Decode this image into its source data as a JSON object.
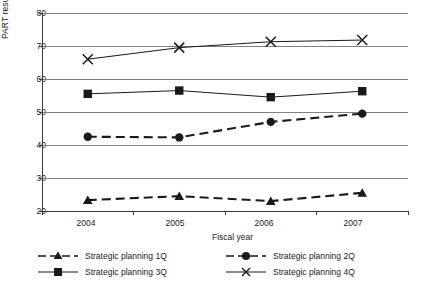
{
  "chart_data": {
    "type": "line",
    "title": "",
    "xlabel": "Fiscal year",
    "ylabel": "PART results score",
    "categories": [
      "2004",
      "2005",
      "2006",
      "2007"
    ],
    "ylim": [
      20,
      80
    ],
    "yticks": [
      "20",
      "30",
      "40",
      "50",
      "60",
      "70",
      "80"
    ],
    "grid": true,
    "legend_position": "bottom",
    "series": [
      {
        "name": "Strategic planning 1Q",
        "marker": "triangle",
        "line_style": "dashed",
        "color": "#1a1a1a",
        "values": [
          23.3,
          24.5,
          23.0,
          25.5
        ]
      },
      {
        "name": "Strategic planning 2Q",
        "marker": "circle",
        "line_style": "dashed",
        "color": "#1a1a1a",
        "values": [
          42.5,
          42.3,
          47.0,
          49.5
        ]
      },
      {
        "name": "Strategic planning 3Q",
        "marker": "square",
        "line_style": "solid",
        "color": "#1a1a1a",
        "values": [
          55.5,
          56.5,
          54.5,
          56.3
        ]
      },
      {
        "name": "Strategic planning 4Q",
        "marker": "x",
        "line_style": "solid",
        "color": "#1a1a1a",
        "values": [
          66.0,
          69.5,
          71.3,
          71.8
        ]
      }
    ]
  },
  "axis": {
    "y_title": "PART results score",
    "x_title": "Fiscal year",
    "y_ticks": [
      "80",
      "70",
      "60",
      "50",
      "40",
      "30",
      "20"
    ],
    "x_ticks": [
      "2004",
      "2005",
      "2006",
      "2007"
    ]
  },
  "legend": {
    "items": [
      {
        "label": "Strategic planning 1Q",
        "marker": "triangle-icon",
        "style": "dashed"
      },
      {
        "label": "Strategic planning 2Q",
        "marker": "circle-icon",
        "style": "dashed"
      },
      {
        "label": "Strategic planning 3Q",
        "marker": "square-icon",
        "style": "solid"
      },
      {
        "label": "Strategic planning 4Q",
        "marker": "x-icon",
        "style": "solid"
      }
    ]
  }
}
